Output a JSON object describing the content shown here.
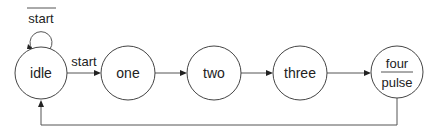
{
  "diagram": {
    "type": "state-machine",
    "states": [
      {
        "id": "idle",
        "label": "idle",
        "cx": 41,
        "cy": 73,
        "r": 26
      },
      {
        "id": "one",
        "label": "one",
        "cx": 128,
        "cy": 73,
        "r": 27
      },
      {
        "id": "two",
        "label": "two",
        "cx": 214,
        "cy": 73,
        "r": 27
      },
      {
        "id": "three",
        "label": "three",
        "cx": 300,
        "cy": 73,
        "r": 27
      },
      {
        "id": "four",
        "label": "four",
        "output": "pulse",
        "cx": 397,
        "cy": 72,
        "r": 26
      }
    ],
    "transitions": [
      {
        "from": "idle",
        "to": "idle",
        "label": "start",
        "negated": true
      },
      {
        "from": "idle",
        "to": "one",
        "label": "start"
      },
      {
        "from": "one",
        "to": "two",
        "label": ""
      },
      {
        "from": "two",
        "to": "three",
        "label": ""
      },
      {
        "from": "three",
        "to": "four",
        "label": ""
      },
      {
        "from": "four",
        "to": "idle",
        "label": ""
      }
    ],
    "colors": {
      "stroke": "#444444",
      "text": "#222222",
      "background": "#ffffff"
    }
  }
}
